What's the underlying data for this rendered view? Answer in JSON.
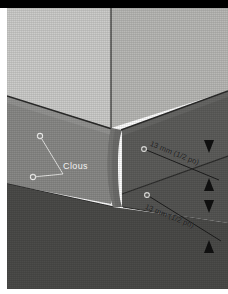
{
  "figure": {
    "language": "fr",
    "banner_color": "#000000",
    "page_background": "#ffffff"
  },
  "palette": {
    "wall_left": "#cdcdcb",
    "wall_right": "#b9b9b6",
    "panel_left_face": "#8a8a88",
    "panel_right_face": "#5e5e5c",
    "panel_lower_dark": "#4c4c4a",
    "bullnose": "#6e6e6c",
    "edge_line": "#2b2b2a",
    "nail_fill": "#e8e8e6",
    "banner": "#000000"
  },
  "labels": {
    "nails": {
      "text": "Clous",
      "color": "#f2f2f2"
    },
    "dimension_upper": {
      "text": "13 mm (1/2 po)",
      "value": 13,
      "unit": "mm",
      "imperial": "1/2 po",
      "color": "#1c1c1c"
    },
    "dimension_lower": {
      "text": "13 mm (1/2 po)",
      "value": 13,
      "unit": "mm",
      "imperial": "1/2 po",
      "color": "#1c1c1c"
    }
  },
  "annotations": {
    "nail_markers": [
      {
        "id": "nail-left-upper",
        "face": "left",
        "cx": 33,
        "cy": 128
      },
      {
        "id": "nail-left-lower",
        "face": "left",
        "cx": 26,
        "cy": 169
      },
      {
        "id": "nail-right-upper",
        "face": "right",
        "cx": 137,
        "cy": 141
      },
      {
        "id": "nail-right-lower",
        "face": "right",
        "cx": 140,
        "cy": 187
      }
    ],
    "dimension_arrows": [
      {
        "id": "arrow-upper-top",
        "direction": "down",
        "x": 202,
        "y": 138
      },
      {
        "id": "arrow-upper-bottom",
        "direction": "up",
        "x": 202,
        "y": 178
      },
      {
        "id": "arrow-lower-top",
        "direction": "down",
        "x": 202,
        "y": 198
      },
      {
        "id": "arrow-lower-bottom",
        "direction": "up",
        "x": 202,
        "y": 240
      }
    ]
  }
}
